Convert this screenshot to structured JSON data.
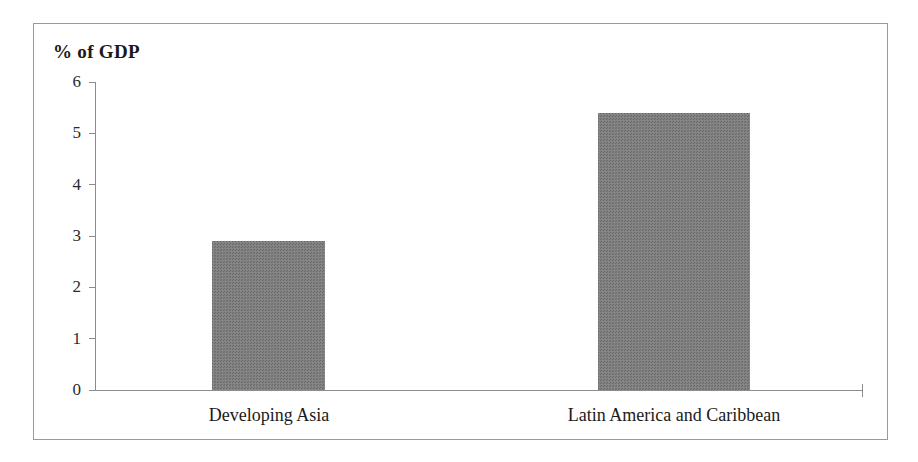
{
  "chart_data": {
    "type": "bar",
    "title": "% of GDP",
    "xlabel": "",
    "ylabel": "% of GDP",
    "categories": [
      "Developing Asia",
      "Latin America and Caribbean"
    ],
    "values": [
      2.9,
      5.4
    ],
    "ylim": [
      0,
      6
    ],
    "yticks": [
      0,
      1,
      2,
      3,
      4,
      5,
      6
    ],
    "ytick_labels": [
      "0",
      "1",
      "2",
      "3",
      "4",
      "5",
      "6"
    ],
    "grid": false,
    "legend": null,
    "bar_color": "#808080",
    "axis_color": "#8d8d8d",
    "background": "#ffffff"
  },
  "figure": {
    "border_color": "#9a9a9a"
  }
}
